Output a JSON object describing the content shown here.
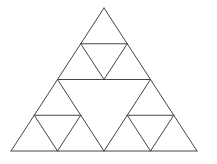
{
  "diagram": {
    "type": "sierpinski-triangle",
    "levels": 2,
    "stroke_color": "#444444",
    "background": "#ffffff",
    "outer_triangle": {
      "apex": [
        104,
        8
      ],
      "bottom_left": [
        11,
        151
      ],
      "bottom_right": [
        197,
        151
      ]
    },
    "segments": [
      [
        104,
        8,
        11,
        151
      ],
      [
        104,
        8,
        197,
        151
      ],
      [
        11,
        151,
        197,
        151
      ],
      [
        57.5,
        79.5,
        150.5,
        79.5
      ],
      [
        57.5,
        79.5,
        104,
        151
      ],
      [
        150.5,
        79.5,
        104,
        151
      ],
      [
        80.75,
        43.75,
        127.25,
        43.75
      ],
      [
        80.75,
        43.75,
        104,
        79.5
      ],
      [
        127.25,
        43.75,
        104,
        79.5
      ],
      [
        34.25,
        115.25,
        80.75,
        115.25
      ],
      [
        34.25,
        115.25,
        57.5,
        151
      ],
      [
        80.75,
        115.25,
        57.5,
        151
      ],
      [
        127.25,
        115.25,
        173.75,
        115.25
      ],
      [
        127.25,
        115.25,
        150.5,
        151
      ],
      [
        173.75,
        115.25,
        150.5,
        151
      ]
    ]
  }
}
